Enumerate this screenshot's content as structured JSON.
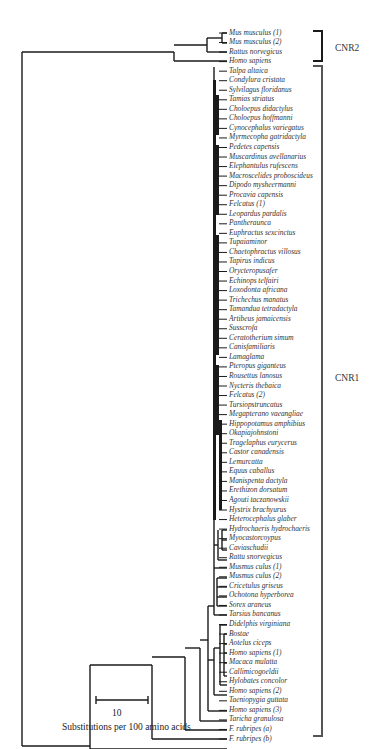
{
  "chart_data": {
    "type": "phylogenetic-tree",
    "title": "",
    "scale_bar": {
      "value": "10",
      "label": "Substitutions per 100 amino acids"
    },
    "groups": [
      {
        "name": "CNR2",
        "members": [
          "Mus musculus (1)",
          "Mus musculus (2)",
          "Rattus norvegicus",
          "Homo sapiens"
        ]
      },
      {
        "name": "CNR1",
        "members_count": 75
      }
    ],
    "leaves": [
      "Mus musculus (1)",
      "Mus musculus (2)",
      "Rattus norvegicus",
      "Homo sapiens",
      "Talpa altaica",
      "Condylura cristata",
      "Sylvilagus floridanus",
      "Tamias striatus",
      "Choloepus didactylus",
      "Choloepus hoffmanni",
      "Cynocephalus variegatus",
      "Myrmecopha gatridactyla",
      "Pedetes capensis",
      "Muscardinus avellanarius",
      "Elephantulus rufescens",
      "Macroscelides proboscideus",
      "Dipodo mysheermanni",
      "Procavia capensis",
      "Felcatus (1)",
      "Leopardus pardalis",
      "Pantheraunca",
      "Euphractus sexcinctus",
      "Tupaiaminor",
      "Chaetophractus villosus",
      "Tapirus indicus",
      "Orycteropusafer",
      "Echinops telfairi",
      "Loxodonta africana",
      "Trichechus manatus",
      "Tamandua tetradactyla",
      "Artibeus jamaicensis",
      "Susscrofa",
      "Ceratotherium simum",
      "Canisfamiliaris",
      "Lamaglama",
      "Pteropus giganteus",
      "Rousettus lanosus",
      "Nycteris thebaica",
      "Felcatus (2)",
      "Tursiopstruncatus",
      "Megapterano vaeangliae",
      "Hippopotamus amphibius",
      "Okapiajohnstoni",
      "Tragelaphus eurycerus",
      "Castor canadensis",
      "Lemurcatta",
      "Equus caballus",
      "Manispenta dactyla",
      "Erethizon dorsatum",
      "Agouti taczanowskii",
      "Hystrix brachyurus",
      "Heterocephalus glaber",
      "Hydrochaeris hydrochaeris",
      "Myocastorcoypus",
      "Caviaschudii",
      "Rattu snorvegicus",
      "Musmus culus (1)",
      "Musmus culus (2)",
      "Cricetulus griseus",
      "Ochotona hyperborea",
      "Sorex araneus",
      "Tarsius bancanus",
      "Didelphis virginiana",
      "Bostae",
      "Aotelus ciceps",
      "Homo sapiens (1)",
      "Macaca mulatta",
      "Callimicogoeldii",
      "Hylobates concolor",
      "Homo sapiens (2)",
      "Taeniopygia guttata",
      "Homo sapiens (3)",
      "Taricha granulosa",
      "F. rubripes (a)",
      "F. rubripes (b)"
    ],
    "layout": {
      "orientation": "rooted-left",
      "leaf_labels": "right",
      "line_color": "#1a1a1a"
    }
  },
  "figure": {
    "groups": {
      "cnr2": "CNR2",
      "cnr1": "CNR1"
    },
    "scale": {
      "value": "10",
      "caption": "Substitutions per 100 amino acids"
    }
  }
}
